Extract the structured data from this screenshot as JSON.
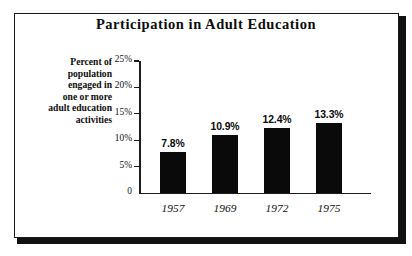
{
  "figure": {
    "title": "Participation in Adult Education",
    "axis_caption_lines": [
      "Percent of",
      "population",
      "engaged in",
      "one or more",
      "adult education",
      "activities"
    ],
    "frame_color": "#1a1a1a",
    "bar_color": "#0a0a0a",
    "background": "#ffffff"
  },
  "chart_data": {
    "type": "bar",
    "title": "Participation in Adult Education",
    "xlabel": "",
    "ylabel": "Percent of population engaged in one or more adult education activities",
    "categories": [
      "1957",
      "1969",
      "1972",
      "1975"
    ],
    "values": [
      7.8,
      10.9,
      12.4,
      13.3
    ],
    "value_labels": [
      "7.8%",
      "10.9%",
      "12.4%",
      "13.3%"
    ],
    "ylim": [
      0,
      25
    ],
    "yticks": [
      0,
      5,
      10,
      15,
      20,
      25
    ],
    "ytick_labels": [
      "0",
      "5%",
      "10%",
      "15%",
      "20%",
      "25%"
    ],
    "grid": false,
    "legend": false
  }
}
